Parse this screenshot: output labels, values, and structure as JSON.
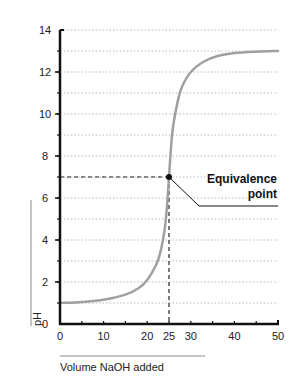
{
  "chart_data": {
    "type": "line",
    "title": "",
    "xlabel": "Volume NaOH added",
    "ylabel": "pH",
    "xlim": [
      0,
      50
    ],
    "ylim": [
      0,
      14
    ],
    "x_ticks": [
      0,
      10,
      20,
      25,
      30,
      40,
      50
    ],
    "x_tick_labels": [
      "0",
      "10",
      "20",
      "25",
      "30",
      "40",
      "50"
    ],
    "y_ticks": [
      0,
      2,
      4,
      6,
      8,
      10,
      12,
      14
    ],
    "y_tick_labels": [
      "0",
      "2",
      "4",
      "6",
      "8",
      "10",
      "12",
      "14"
    ],
    "grid": {
      "horizontal": true,
      "style": "dotted",
      "every": 1
    },
    "series": [
      {
        "name": "Titration curve",
        "color": "#a0a0a0",
        "x": [
          0,
          5,
          10,
          15,
          18,
          20,
          22,
          23,
          24,
          24.5,
          25,
          25.5,
          26,
          27,
          28,
          30,
          33,
          36,
          40,
          45,
          50
        ],
        "y": [
          1.0,
          1.05,
          1.15,
          1.4,
          1.7,
          2.1,
          2.8,
          3.4,
          4.5,
          5.5,
          7.0,
          8.5,
          9.5,
          10.6,
          11.3,
          12.0,
          12.5,
          12.75,
          12.9,
          12.97,
          13.0
        ]
      }
    ],
    "annotations": [
      {
        "text": "Equivalence point",
        "x": 25,
        "y": 7,
        "marker": "dot",
        "guides": "dashed lines to both axes"
      }
    ],
    "legend": null
  },
  "labels": {
    "annotation_line1": "Equivalence",
    "annotation_line2": "point",
    "xlabel": "Volume NaOH added",
    "ylabel": "pH"
  }
}
